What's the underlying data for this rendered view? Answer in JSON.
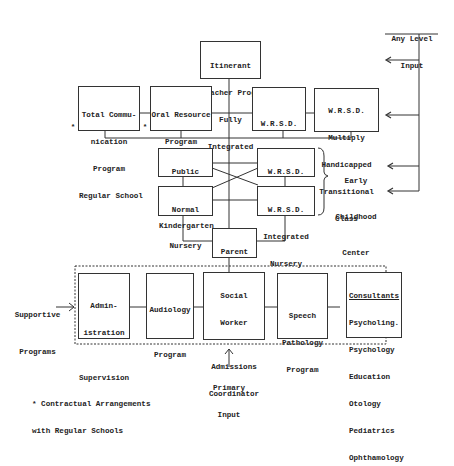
{
  "diagram": {
    "any_level_input": [
      "Any Level",
      "Input"
    ],
    "itinerant": [
      "Itinerant",
      "Teacher Prog.",
      "Fully",
      "Integrated"
    ],
    "total_comm": [
      "Total Commu-",
      "nication",
      "Program",
      "Regular School"
    ],
    "total_comm_asterisk": "*",
    "oral_resource": [
      "Oral Resource",
      "Program",
      "Regular",
      "School"
    ],
    "oral_resource_asterisk": "*",
    "wrsd_classes": [
      "W.R.S.D.",
      "Classes"
    ],
    "wrsd_multiply": [
      "W.R.S.D.",
      "Multiply",
      "Handicapped",
      "Transitional",
      "Class"
    ],
    "public_kinder": [
      "Public",
      "School",
      "Kindergarten"
    ],
    "wrsd_kinder": [
      "W.R.S.D.",
      "Kindergarten"
    ],
    "normal_nursery": [
      "Normal",
      "Nursery"
    ],
    "wrsd_integrated": [
      "W.R.S.D.",
      "Integrated",
      "Nursery"
    ],
    "early_childhood": [
      "Early",
      "Childhood",
      "Center"
    ],
    "parent_infant": [
      "Parent",
      "Infant",
      "Program"
    ],
    "supportive": [
      "Supportive",
      "Programs"
    ],
    "administration": [
      "Admin-",
      "istration"
    ],
    "supervision": "Supervision",
    "audiology": [
      "Audiology",
      "Program"
    ],
    "social_worker": [
      "Social",
      "Worker"
    ],
    "admissions": [
      "Admissions",
      "Coordinator"
    ],
    "speech": [
      "Speech",
      "Pathology",
      "Program"
    ],
    "consultants_title": "Consultants",
    "consultants": [
      "Psycholing.",
      "Psychology",
      "Education",
      "Otology",
      "Pediatrics",
      "Ophthamology"
    ],
    "primary_input": [
      "Primary",
      "Input"
    ],
    "footnote": [
      "* Contractual Arrangements",
      "  with Regular Schools"
    ]
  }
}
